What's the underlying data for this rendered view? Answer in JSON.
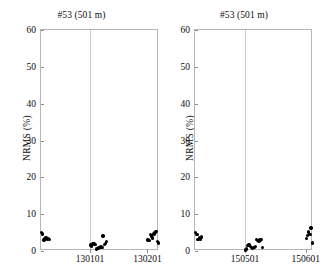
{
  "figure": {
    "width": 325,
    "height": 275,
    "background": "#ffffff",
    "marker_color": "#000000",
    "axis_color": "#b6b6b6",
    "grid_color": "#c9c9c9"
  },
  "panels": [
    {
      "id": "left",
      "title": "#53 (501 m)",
      "ylabel": "NRMS (%)",
      "ytick_labels": [
        "0",
        "10",
        "20",
        "30",
        "40",
        "50",
        "60"
      ],
      "xtick_labels": [
        "130101",
        "130201"
      ]
    },
    {
      "id": "right",
      "title": "#53 (501 m)",
      "ylabel": "NRMS (%)",
      "ytick_labels": [
        "0",
        "10",
        "20",
        "30",
        "40",
        "50",
        "60"
      ],
      "xtick_labels": [
        "150501",
        "150601"
      ]
    }
  ],
  "chart_data": [
    {
      "type": "scatter",
      "panel": "left",
      "title": "#53 (501 m)",
      "xlabel": "",
      "ylabel": "NRMS (%)",
      "ylim": [
        0,
        60
      ],
      "yticks": [
        0,
        10,
        20,
        30,
        40,
        50,
        60
      ],
      "xticks": [
        130101,
        130201
      ],
      "xtick_labels": [
        "130101",
        "130201"
      ],
      "xlim": [
        130016,
        130221
      ],
      "grid": "vertical-only",
      "legend": "none",
      "marker": "filled-circle",
      "marker_color": "#000000",
      "x": [
        130017,
        130019,
        130021,
        130023,
        130025,
        130027,
        130029,
        130031,
        130102,
        130104,
        130106,
        130108,
        130110,
        130112,
        130114,
        130116,
        130118,
        130120,
        130122,
        130124,
        130126,
        130128,
        130130,
        130202,
        130204,
        130206,
        130208,
        130210,
        130212,
        130214,
        130216,
        130218,
        130220
      ],
      "y": [
        5.0,
        4.6,
        3.0,
        3.3,
        3.6,
        3.1,
        3.4,
        3.2,
        1.6,
        1.4,
        2.0,
        1.9,
        1.7,
        0.5,
        0.6,
        0.8,
        1.0,
        1.1,
        0.9,
        4.1,
        1.7,
        2.0,
        2.6,
        3.0,
        2.8,
        4.4,
        4.1,
        3.5,
        4.6,
        5.1,
        5.3,
        2.5,
        2.2
      ],
      "series": [
        {
          "name": "NRMS",
          "values": [
            5.0,
            4.6,
            3.0,
            3.3,
            3.6,
            3.1,
            3.4,
            3.2,
            1.6,
            1.4,
            2.0,
            1.9,
            1.7,
            0.5,
            0.6,
            0.8,
            1.0,
            1.1,
            0.9,
            4.1,
            1.7,
            2.0,
            2.6,
            3.0,
            2.8,
            4.4,
            4.1,
            3.5,
            4.6,
            5.1,
            5.3,
            2.5,
            2.2
          ]
        }
      ]
    },
    {
      "type": "scatter",
      "panel": "right",
      "title": "#53 (501 m)",
      "xlabel": "",
      "ylabel": "NRMS (%)",
      "ylim": [
        0,
        60
      ],
      "yticks": [
        0,
        10,
        20,
        30,
        40,
        50,
        60
      ],
      "xticks": [
        150501,
        150601
      ],
      "xtick_labels": [
        "150501",
        "150601"
      ],
      "xlim": [
        150419,
        150613
      ],
      "grid": "vertical-only",
      "legend": "none",
      "marker": "filled-circle",
      "marker_color": "#000000",
      "x": [
        150420,
        150422,
        150424,
        150426,
        150428,
        150430,
        150502,
        150504,
        150506,
        150508,
        150510,
        150512,
        150514,
        150516,
        150518,
        150520,
        150522,
        150524,
        150526,
        150528,
        150530,
        150602,
        150604,
        150606,
        150608,
        150610,
        150612
      ],
      "y": [
        5.0,
        4.5,
        3.2,
        3.6,
        3.1,
        3.8,
        0.3,
        0.5,
        1.5,
        1.8,
        1.3,
        0.9,
        0.7,
        1.0,
        1.2,
        3.2,
        2.9,
        2.7,
        3.0,
        3.1,
        1.0,
        3.4,
        4.2,
        5.2,
        4.4,
        6.2,
        2.2
      ],
      "series": [
        {
          "name": "NRMS",
          "values": [
            5.0,
            4.5,
            3.2,
            3.6,
            3.1,
            3.8,
            0.3,
            0.5,
            1.5,
            1.8,
            1.3,
            0.9,
            0.7,
            1.0,
            1.2,
            3.2,
            2.9,
            2.7,
            3.0,
            3.1,
            1.0,
            3.4,
            4.2,
            5.2,
            4.4,
            6.2,
            2.2
          ]
        }
      ]
    }
  ]
}
